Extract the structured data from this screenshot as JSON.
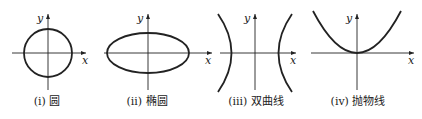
{
  "figure": {
    "panels": [
      {
        "id": "circle",
        "caption": "(i) 圆",
        "x_label": "x",
        "y_label": "y"
      },
      {
        "id": "ellipse",
        "caption": "(ii) 椭圆",
        "x_label": "x",
        "y_label": "y"
      },
      {
        "id": "hyperbola",
        "caption": "(iii) 双曲线",
        "x_label": "x",
        "y_label": "y"
      },
      {
        "id": "parabola",
        "caption": "(iv) 抛物线",
        "x_label": "x",
        "y_label": "y"
      }
    ],
    "stroke_color": "#222222"
  }
}
